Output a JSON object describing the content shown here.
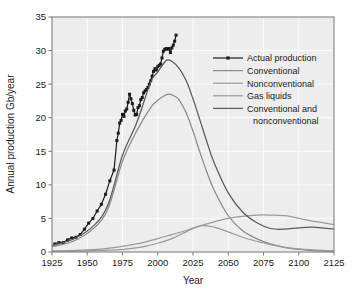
{
  "chart_data": {
    "type": "line",
    "title": "",
    "xlabel": "Year",
    "ylabel": "Annual production Gb/year",
    "xlim": [
      1925,
      2125
    ],
    "ylim": [
      0,
      35
    ],
    "xticks": [
      1925,
      1950,
      1975,
      2000,
      2025,
      2050,
      2075,
      2100,
      2125
    ],
    "yticks": [
      0,
      5,
      10,
      15,
      20,
      25,
      30,
      35
    ],
    "grid": true,
    "legend_position": "right-upper-inside",
    "series": [
      {
        "name": "Actual production",
        "style": "line-with-markers",
        "color": "#1a1a1a",
        "x": [
          1927,
          1930,
          1933,
          1936,
          1939,
          1942,
          1945,
          1948,
          1951,
          1954,
          1957,
          1960,
          1963,
          1966,
          1969,
          1971,
          1972,
          1973,
          1974,
          1975,
          1976,
          1977,
          1978,
          1979,
          1980,
          1981,
          1982,
          1983,
          1984,
          1985,
          1986,
          1987,
          1988,
          1989,
          1990,
          1991,
          1992,
          1993,
          1994,
          1995,
          1996,
          1997,
          1998,
          1999,
          2000,
          2001,
          2002,
          2003,
          2004,
          2005,
          2006,
          2007,
          2008,
          2009,
          2010,
          2011,
          2012,
          2013
        ],
        "y": [
          1.2,
          1.4,
          1.4,
          1.8,
          2.1,
          2.2,
          2.6,
          3.4,
          4.3,
          5.0,
          6.1,
          7.1,
          8.6,
          10.6,
          12.2,
          16.6,
          17.7,
          19.2,
          19.6,
          20.5,
          20.2,
          21.0,
          21.3,
          22.3,
          23.5,
          22.8,
          22.1,
          21.1,
          20.4,
          20.5,
          21.5,
          21.8,
          22.7,
          23.0,
          23.7,
          24.0,
          24.2,
          24.5,
          25.0,
          25.5,
          26.2,
          26.9,
          27.3,
          27.1,
          27.6,
          27.8,
          28.0,
          28.9,
          29.9,
          30.2,
          30.3,
          30.2,
          30.3,
          29.7,
          30.4,
          30.8,
          31.4,
          32.3
        ]
      },
      {
        "name": "Conventional",
        "style": "line",
        "color": "#8a8a8a",
        "x": [
          1925,
          1940,
          1955,
          1965,
          1975,
          1985,
          1995,
          2000,
          2005,
          2008,
          2012,
          2015,
          2020,
          2025,
          2030,
          2035,
          2040,
          2050,
          2060,
          2070,
          2080,
          2090,
          2100,
          2110,
          2125
        ],
        "y": [
          0.8,
          1.6,
          3.6,
          6.6,
          13.5,
          18.0,
          21.5,
          22.6,
          23.3,
          23.5,
          23.2,
          22.7,
          20.8,
          18.0,
          14.8,
          11.8,
          9.2,
          5.4,
          3.2,
          2.0,
          1.2,
          0.7,
          0.4,
          0.2,
          0.1
        ]
      },
      {
        "name": "Nonconventional",
        "style": "line",
        "color": "#9a9a9a",
        "x": [
          1925,
          1950,
          1970,
          1980,
          1990,
          2000,
          2010,
          2020,
          2030,
          2040,
          2050,
          2060,
          2070,
          2080,
          2090,
          2100,
          2110,
          2125
        ],
        "y": [
          0.1,
          0.15,
          0.3,
          0.5,
          0.8,
          1.3,
          2.0,
          3.0,
          3.9,
          3.7,
          3.0,
          2.2,
          1.6,
          1.1,
          0.7,
          0.45,
          0.3,
          0.15
        ]
      },
      {
        "name": "Gas liquids",
        "style": "line",
        "color": "#9a9a9a",
        "x": [
          1925,
          1950,
          1970,
          1985,
          2000,
          2010,
          2020,
          2030,
          2040,
          2050,
          2060,
          2070,
          2080,
          2090,
          2100,
          2110,
          2125
        ],
        "y": [
          0.15,
          0.3,
          0.7,
          1.2,
          2.0,
          2.6,
          3.2,
          3.9,
          4.5,
          5.0,
          5.3,
          5.5,
          5.5,
          5.4,
          5.0,
          4.6,
          4.1
        ]
      },
      {
        "name": "Conventional and nonconventional",
        "style": "line",
        "color": "#5a5a5a",
        "x": [
          1925,
          1940,
          1955,
          1965,
          1975,
          1985,
          1995,
          2000,
          2005,
          2007,
          2010,
          2015,
          2020,
          2025,
          2030,
          2035,
          2040,
          2050,
          2060,
          2070,
          2080,
          2090,
          2100,
          2110,
          2125
        ],
        "y": [
          1.0,
          1.9,
          4.0,
          7.2,
          14.4,
          19.2,
          25.3,
          26.8,
          28.3,
          28.6,
          28.4,
          27.4,
          25.6,
          22.8,
          19.6,
          16.3,
          13.3,
          8.8,
          6.0,
          4.4,
          3.5,
          3.4,
          3.6,
          3.7,
          3.4
        ]
      }
    ]
  },
  "legend": {
    "items": [
      {
        "label": "Actual production",
        "marker": "line-marker",
        "color": "#1a1a1a"
      },
      {
        "label": "Conventional",
        "marker": "line",
        "color": "#8a8a8a"
      },
      {
        "label": "Nonconventional",
        "marker": "line",
        "color": "#9a9a9a"
      },
      {
        "label": "Gas liquids",
        "marker": "line",
        "color": "#9a9a9a"
      },
      {
        "label": "Conventional and",
        "marker": "line",
        "color": "#5a5a5a"
      },
      {
        "label": "nonconventional",
        "marker": "none",
        "color": "#5a5a5a"
      }
    ]
  },
  "axes": {
    "x_title": "Year",
    "y_title": "Annual production Gb/year",
    "x_tick_labels": [
      "1925",
      "1950",
      "1975",
      "2000",
      "2025",
      "2050",
      "2075",
      "2100",
      "2125"
    ],
    "y_tick_labels": [
      "0",
      "5",
      "10",
      "15",
      "20",
      "25",
      "30",
      "35"
    ]
  },
  "style": {
    "plot_background": "#ededed",
    "grid_color": "#fbfbfb",
    "frame_color": "#808080",
    "text_color": "#1a1a1a"
  }
}
